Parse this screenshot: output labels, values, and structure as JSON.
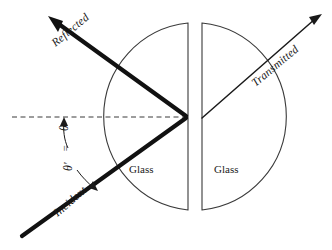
{
  "figure": {
    "background_color": "#ffffff",
    "stroke_color": "#1a1a1a",
    "thin_stroke_color": "#3a3a3a",
    "width": 332,
    "height": 250
  },
  "labels": {
    "reflected": "Reflected",
    "transmitted": "Transmitted",
    "incident": "Incident",
    "glass_left": "Glass",
    "glass_right": "Glass",
    "theta": "θ",
    "theta_prime": "θ'",
    "equals": "="
  },
  "geometry": {
    "interface_point_x": 188,
    "interface_point_y": 117,
    "normal_dashed_from_x": 12,
    "normal_dashed_to_x": 188,
    "normal_dashed_y": 117,
    "incident_start_x": 22,
    "incident_start_y": 236,
    "reflected_tip_x": 48,
    "reflected_tip_y": 16,
    "transmitted_start_x": 202,
    "transmitted_start_y": 118,
    "transmitted_tip_x": 322,
    "transmitted_tip_y": 14,
    "left_semicircle_flat_x": 188,
    "left_semicircle_top_y": 23,
    "left_semicircle_bottom_y": 210,
    "left_semicircle_bulge_x": 96,
    "right_semicircle_flat_x": 202,
    "right_semicircle_top_y": 23,
    "right_semicircle_bottom_y": 210,
    "right_semicircle_bulge_x": 283,
    "incident_angle_deg": 40,
    "reflected_angle_deg": 40,
    "transmitted_angle_deg": 40
  }
}
